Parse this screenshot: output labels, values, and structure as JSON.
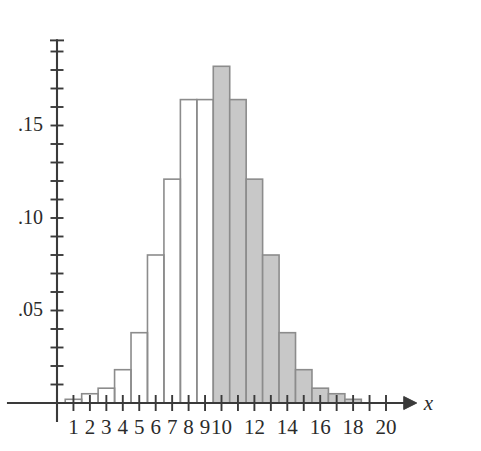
{
  "chart_data": {
    "type": "bar",
    "title": "",
    "subtitle": "",
    "xlabel": "x",
    "ylabel": "",
    "categories": [
      1,
      2,
      3,
      4,
      5,
      6,
      7,
      8,
      9,
      10,
      11,
      12,
      13,
      14,
      15,
      16,
      17,
      18
    ],
    "values": [
      0.002,
      0.005,
      0.008,
      0.018,
      0.038,
      0.08,
      0.121,
      0.164,
      0.164,
      0.182,
      0.164,
      0.121,
      0.08,
      0.038,
      0.018,
      0.008,
      0.005,
      0.002
    ],
    "bar_fill": [
      "none",
      "none",
      "none",
      "none",
      "none",
      "none",
      "none",
      "none",
      "none",
      "shaded",
      "shaded",
      "shaded",
      "shaded",
      "shaded",
      "shaded",
      "shaded",
      "shaded",
      "shaded"
    ],
    "shaded_from": 10,
    "shaded_to": 18,
    "bar_width": 1,
    "xlim": [
      0,
      21
    ],
    "ylim": [
      0,
      0.2
    ],
    "x_tick_values": [
      1,
      2,
      3,
      4,
      5,
      6,
      7,
      8,
      9,
      10,
      11,
      12,
      13,
      14,
      15,
      16,
      17,
      18,
      19,
      20
    ],
    "x_tick_labels": [
      {
        "value": 1,
        "label": "1"
      },
      {
        "value": 2,
        "label": "2"
      },
      {
        "value": 3,
        "label": "3"
      },
      {
        "value": 4,
        "label": "4"
      },
      {
        "value": 5,
        "label": "5"
      },
      {
        "value": 6,
        "label": "6"
      },
      {
        "value": 7,
        "label": "7"
      },
      {
        "value": 8,
        "label": "8"
      },
      {
        "value": 9,
        "label": "9"
      },
      {
        "value": 10,
        "label": "10"
      },
      {
        "value": 12,
        "label": "12"
      },
      {
        "value": 14,
        "label": "14"
      },
      {
        "value": 16,
        "label": "16"
      },
      {
        "value": 18,
        "label": "18"
      },
      {
        "value": 20,
        "label": "20"
      }
    ],
    "y_tick_values": [
      0.01,
      0.02,
      0.03,
      0.04,
      0.05,
      0.06,
      0.07,
      0.08,
      0.09,
      0.1,
      0.11,
      0.12,
      0.13,
      0.14,
      0.15,
      0.16,
      0.17,
      0.18,
      0.19
    ],
    "y_tick_labels": [
      {
        "value": 0.05,
        "label": ".05"
      },
      {
        "value": 0.1,
        "label": ".10"
      },
      {
        "value": 0.15,
        "label": ".15"
      }
    ],
    "grid": false,
    "legend": null,
    "x_axis_arrow": true,
    "colors": {
      "shaded_fill": "#c8c8c8",
      "bar_stroke": "#8c8c8c",
      "axis": "#3a3a3a",
      "background": "#ffffff",
      "text": "#2b2b2b"
    }
  }
}
